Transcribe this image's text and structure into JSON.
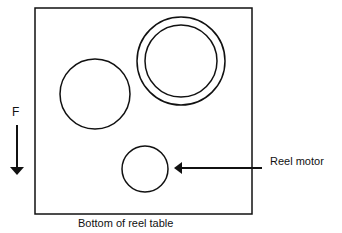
{
  "diagram": {
    "force_label": "F",
    "pointer_label": "Reel motor",
    "caption": "Bottom of reel table",
    "shapes": {
      "table": "square outline",
      "left_reel": "circle",
      "right_reel": "double circle",
      "reel_motor": "small circle"
    },
    "colors": {
      "line": "#111111",
      "background": "#ffffff"
    }
  }
}
